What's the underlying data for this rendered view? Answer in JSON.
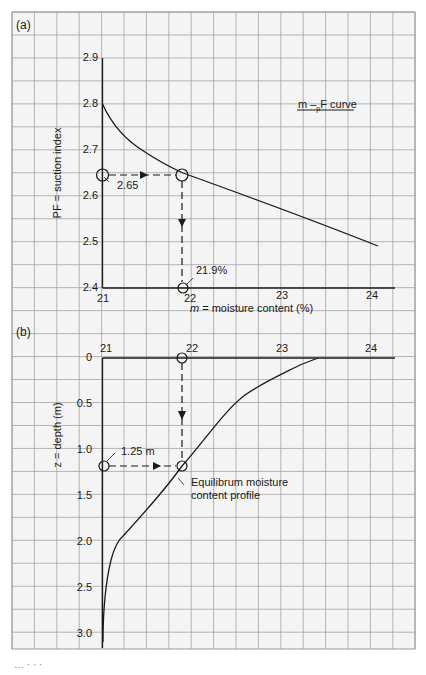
{
  "chart_data": [
    {
      "panel": "(a)",
      "type": "line",
      "title": "m – pF curve",
      "xlabel": "m = moisture content (%)",
      "ylabel": "PF = suction index",
      "xlim": [
        21,
        24
      ],
      "ylim": [
        2.4,
        2.9
      ],
      "x_ticks": [
        "21",
        "22",
        "23",
        "24"
      ],
      "y_ticks": [
        "2.9",
        "2.8",
        "2.7",
        "2.6",
        "2.5",
        "2.4"
      ],
      "grid": true,
      "series": [
        {
          "name": "m-pF curve",
          "x": [
            21.0,
            21.1,
            21.25,
            21.5,
            21.75,
            21.9,
            22.25,
            22.5,
            23.0,
            23.5,
            23.8
          ],
          "y": [
            2.8,
            2.76,
            2.72,
            2.69,
            2.665,
            2.65,
            2.63,
            2.61,
            2.575,
            2.53,
            2.49
          ]
        }
      ],
      "annotations": [
        {
          "text": "2.65",
          "x": 21,
          "y": 2.65,
          "note": "start point on PF axis, dashed arrow right to curve"
        },
        {
          "text": "21.9%",
          "x": 21.9,
          "y": 2.4,
          "note": "dashed arrow down from curve to moisture axis"
        }
      ]
    },
    {
      "panel": "(b)",
      "type": "line",
      "title": "",
      "xlabel": "",
      "ylabel": "z = depth (m)",
      "xlim": [
        21,
        24
      ],
      "ylim": [
        3.0,
        0
      ],
      "x_ticks": [
        "21",
        "22",
        "23",
        "24"
      ],
      "y_ticks": [
        "0",
        "0.5",
        "1.0",
        "1.5",
        "2.0",
        "2.5",
        "3.0"
      ],
      "grid": true,
      "series": [
        {
          "name": "Equilibrum moisture content profile",
          "x": [
            21.0,
            21.02,
            21.08,
            21.15,
            21.25,
            21.5,
            21.9,
            22.3,
            22.7,
            23.0,
            23.6
          ],
          "y": [
            3.1,
            2.8,
            2.4,
            2.15,
            2.0,
            1.75,
            1.25,
            0.85,
            0.5,
            0.3,
            0.0
          ]
        }
      ],
      "annotations": [
        {
          "text": "1.25 m",
          "x": 21,
          "y": 1.25,
          "note": "dashed arrow right from depth axis to profile"
        },
        {
          "text": "Equilibrum moisture content profile",
          "x": 21.9,
          "y": 1.25
        }
      ]
    }
  ],
  "labels": {
    "panel_a": "(a)",
    "panel_b": "(b)",
    "curve_title": "m – pF curve",
    "curve_title_m": "m –",
    "curve_title_sub": "p",
    "curve_title_rest": "F curve",
    "a_ylabel": "PF = suction index",
    "a_xlabel_italic": "m",
    "a_xlabel_rest": " = moisture content (%)",
    "b_ylabel": "z = depth (m)",
    "a_point_label": "2.65",
    "a_result_label": "21.9%",
    "b_point_label": "1.25 m",
    "b_curve_label_1": "Equilibrum moisture",
    "b_curve_label_2": "content profile",
    "a_xticks": [
      "21",
      "22",
      "23",
      "24"
    ],
    "a_yticks": [
      "2.9",
      "2.8",
      "2.7",
      "2.6",
      "2.5",
      "2.4"
    ],
    "b_xticks": [
      "21",
      "22",
      "23",
      "24"
    ],
    "b_yticks": [
      "0",
      "0.5",
      "1.0",
      "1.5",
      "2.0",
      "2.5",
      "3.0"
    ],
    "footer_fragment": "...-1-2.5"
  },
  "colors": {
    "grid": "#9a9a9a",
    "paper": "#f4f4f4",
    "ink": "#1a1a1a"
  }
}
